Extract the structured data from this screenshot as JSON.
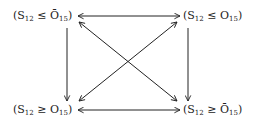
{
  "diagram": {
    "nodes": {
      "top_left": {
        "open": "(S",
        "s_sub": "12",
        "rel": " ≤ ",
        "o": "Ō",
        "o_sub": "15",
        "close": ")",
        "overline": true
      },
      "top_right": {
        "open": "(S",
        "s_sub": "12",
        "rel": " ≤ ",
        "o": "O",
        "o_sub": "15",
        "close": ")",
        "overline": false
      },
      "bottom_left": {
        "open": "(S",
        "s_sub": "12",
        "rel": " ≥ ",
        "o": "O",
        "o_sub": "15",
        "close": ")",
        "overline": false
      },
      "bottom_right": {
        "open": "(S",
        "s_sub": "12",
        "rel": " ≥ ",
        "o": "Ō",
        "o_sub": "15",
        "close": ")",
        "overline": true
      }
    },
    "edges": [
      {
        "from": "top_left",
        "to": "top_right",
        "type": "bidirectional"
      },
      {
        "from": "bottom_left",
        "to": "bottom_right",
        "type": "bidirectional"
      },
      {
        "from": "top_left",
        "to": "bottom_left",
        "type": "directed-down"
      },
      {
        "from": "top_right",
        "to": "bottom_right",
        "type": "directed-down"
      },
      {
        "from": "top_left",
        "to": "bottom_right",
        "type": "bidirectional"
      },
      {
        "from": "top_right",
        "to": "bottom_left",
        "type": "bidirectional"
      }
    ],
    "stroke_color": "#222222"
  }
}
